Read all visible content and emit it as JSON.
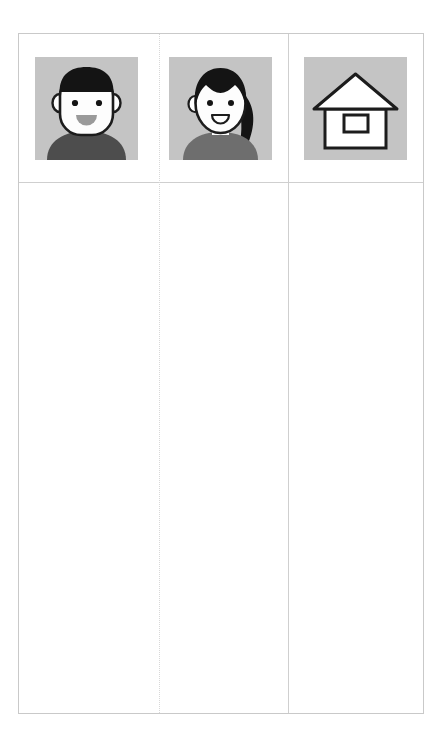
{
  "card": {
    "columns": 3,
    "border_color": "#c9c9c9",
    "divider_color": "#cfcfcf",
    "background": "#ffffff"
  },
  "palette": {
    "tile_background": "#c4c4c4",
    "hair": "#141414",
    "skin": "#fdfdfd",
    "outline": "#1c1c1c",
    "shirt_male": "#4d4d4d",
    "shirt_female": "#6e6e6e",
    "mouth": "#9a9a9a",
    "house_fill": "#ffffff"
  },
  "header_cells": [
    {
      "icon": "male-avatar-icon",
      "label": "Man avatar"
    },
    {
      "icon": "female-avatar-icon",
      "label": "Woman avatar"
    },
    {
      "icon": "house-icon",
      "label": "House"
    }
  ],
  "body_cells": [
    {
      "text": ""
    },
    {
      "text": ""
    },
    {
      "text": ""
    }
  ]
}
